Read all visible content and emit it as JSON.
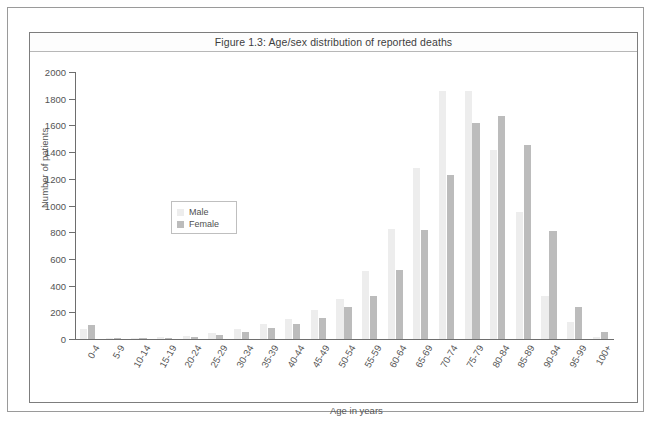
{
  "chart_data": {
    "type": "bar",
    "title": "Figure 1.3: Age/sex distribution of reported deaths",
    "xlabel": "Age in years",
    "ylabel": "Number of patients",
    "ylim": [
      0,
      2000
    ],
    "ytick_step": 200,
    "yticks": [
      0,
      200,
      400,
      600,
      800,
      1000,
      1200,
      1400,
      1600,
      1800,
      2000
    ],
    "grid": false,
    "legend_position": "inside-left",
    "categories": [
      "0-4",
      "5-9",
      "10-14",
      "15-19",
      "20-24",
      "25-29",
      "30-34",
      "35-39",
      "40-44",
      "45-49",
      "50-54",
      "55-59",
      "60-64",
      "65-69",
      "70-74",
      "75-79",
      "80-84",
      "85-89",
      "90-94",
      "95-99",
      "100+"
    ],
    "series": [
      {
        "name": "Male",
        "color": "#ededed",
        "values": [
          78,
          8,
          10,
          14,
          20,
          42,
          78,
          110,
          150,
          215,
          300,
          510,
          825,
          1280,
          1855,
          1855,
          1415,
          955,
          320,
          130,
          15
        ]
      },
      {
        "name": "Female",
        "color": "#bcbcbc",
        "values": [
          105,
          6,
          8,
          10,
          14,
          28,
          55,
          85,
          115,
          160,
          240,
          320,
          520,
          815,
          1225,
          1620,
          1670,
          1455,
          810,
          240,
          50
        ]
      }
    ]
  },
  "legend": {
    "items": [
      {
        "label": "Male",
        "color": "#ededed"
      },
      {
        "label": "Female",
        "color": "#bcbcbc"
      }
    ]
  }
}
